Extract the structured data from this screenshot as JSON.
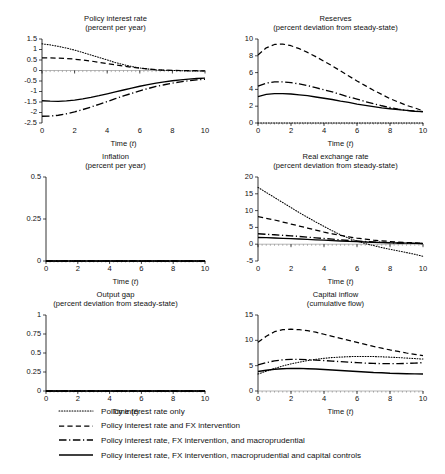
{
  "figure": {
    "x_axis_title": "Time (t)",
    "x_axis_title_main": "Time (",
    "x_axis_title_var": "t",
    "x_axis_title_end": ")"
  },
  "legend": {
    "position": "bottom",
    "items": [
      {
        "label": "Policy interest rate only",
        "style": "dotted",
        "key": "dotted-line-key"
      },
      {
        "label": "Policy interest rate and FX intervention",
        "style": "dashed",
        "key": "dashed-line-key"
      },
      {
        "label": "Policy interest rate, FX intervention, and macroprudential",
        "style": "dashdot",
        "key": "dashdot-line-key"
      },
      {
        "label": "Policy interest rate, FX intervention, macroprudential and capital controls",
        "style": "solid",
        "key": "solid-line-key"
      }
    ]
  },
  "chart_data": [
    {
      "id": "policy-interest-rate",
      "type": "line",
      "title": "Policy interest rate",
      "subtitle": "(percent per year)",
      "xlabel": "Time (t)",
      "ylabel": "",
      "xlim": [
        0,
        10
      ],
      "ylim": [
        -2.5,
        1.5
      ],
      "xticks": [
        0,
        2,
        4,
        6,
        8,
        10
      ],
      "yticks": [
        1.5,
        1,
        0.5,
        0,
        -0.5,
        -1,
        -1.5,
        -2,
        -2.5
      ],
      "ytick_labels": [
        "1.5",
        "1",
        "0.5",
        "0",
        "-0.5",
        "-1",
        "-1.5",
        "-2",
        "-2.5"
      ],
      "grid": false,
      "x": [
        0,
        0.5,
        1,
        1.5,
        2,
        2.5,
        3,
        3.5,
        4,
        4.5,
        5,
        5.5,
        6,
        6.5,
        7,
        7.5,
        8,
        8.5,
        9,
        9.5,
        10
      ],
      "series": [
        {
          "name": "Policy interest rate only",
          "style": "dotted",
          "values": [
            1.27,
            1.22,
            1.15,
            1.07,
            0.97,
            0.86,
            0.74,
            0.62,
            0.5,
            0.38,
            0.28,
            0.19,
            0.12,
            0.07,
            0.03,
            0.01,
            0.0,
            -0.01,
            -0.02,
            -0.02,
            -0.03
          ]
        },
        {
          "name": "Policy interest rate and FX intervention",
          "style": "dashed",
          "values": [
            0.6,
            0.6,
            0.59,
            0.57,
            0.54,
            0.5,
            0.45,
            0.39,
            0.33,
            0.27,
            0.21,
            0.16,
            0.11,
            0.07,
            0.04,
            0.02,
            0.01,
            0.0,
            -0.01,
            -0.01,
            -0.02
          ]
        },
        {
          "name": "Policy interest rate, FX intervention, and macroprudential",
          "style": "dashdot",
          "values": [
            -2.18,
            -2.17,
            -2.13,
            -2.06,
            -1.97,
            -1.86,
            -1.74,
            -1.61,
            -1.48,
            -1.34,
            -1.21,
            -1.09,
            -0.97,
            -0.86,
            -0.76,
            -0.68,
            -0.6,
            -0.54,
            -0.49,
            -0.45,
            -0.42
          ]
        },
        {
          "name": "Policy interest rate, FX intervention, macroprudential and capital controls",
          "style": "solid",
          "values": [
            -1.44,
            -1.46,
            -1.47,
            -1.45,
            -1.41,
            -1.35,
            -1.28,
            -1.2,
            -1.11,
            -1.02,
            -0.93,
            -0.84,
            -0.75,
            -0.67,
            -0.6,
            -0.54,
            -0.49,
            -0.45,
            -0.41,
            -0.38,
            -0.36
          ]
        }
      ]
    },
    {
      "id": "reserves",
      "type": "line",
      "title": "Reserves",
      "subtitle": "(percent deviation from steady-state)",
      "xlabel": "Time (t)",
      "ylabel": "",
      "xlim": [
        0,
        10
      ],
      "ylim": [
        0,
        10
      ],
      "xticks": [
        0,
        2,
        4,
        6,
        8,
        10
      ],
      "yticks": [
        0,
        2,
        4,
        6,
        8,
        10
      ],
      "ytick_labels": [
        "0",
        "2",
        "4",
        "6",
        "8",
        "10"
      ],
      "grid": false,
      "x": [
        0,
        0.5,
        1,
        1.5,
        2,
        2.5,
        3,
        3.5,
        4,
        4.5,
        5,
        5.5,
        6,
        6.5,
        7,
        7.5,
        8,
        8.5,
        9,
        9.5,
        10
      ],
      "series": [
        {
          "name": "Policy interest rate only",
          "style": "dotted",
          "values": [
            0,
            0,
            0,
            0,
            0,
            0,
            0,
            0,
            0,
            0,
            0,
            0,
            0,
            0,
            0,
            0,
            0,
            0,
            0,
            0,
            0
          ]
        },
        {
          "name": "Policy interest rate and FX intervention",
          "style": "dashed",
          "values": [
            8.1,
            8.95,
            9.35,
            9.4,
            9.2,
            8.85,
            8.4,
            7.9,
            7.35,
            6.8,
            6.2,
            5.6,
            5.0,
            4.45,
            3.9,
            3.4,
            2.9,
            2.5,
            2.1,
            1.8,
            1.45
          ]
        },
        {
          "name": "Policy interest rate, FX intervention, and macroprudential",
          "style": "dashdot",
          "values": [
            4.4,
            4.75,
            4.9,
            4.9,
            4.8,
            4.65,
            4.45,
            4.2,
            3.95,
            3.7,
            3.4,
            3.1,
            2.85,
            2.55,
            2.3,
            2.05,
            1.85,
            1.65,
            1.5,
            1.4,
            1.35
          ]
        },
        {
          "name": "Policy interest rate, FX intervention, macroprudential and capital controls",
          "style": "solid",
          "values": [
            3.15,
            3.4,
            3.5,
            3.5,
            3.45,
            3.35,
            3.25,
            3.1,
            2.95,
            2.8,
            2.6,
            2.45,
            2.25,
            2.1,
            1.95,
            1.8,
            1.7,
            1.6,
            1.5,
            1.4,
            1.35
          ]
        }
      ]
    },
    {
      "id": "inflation",
      "type": "line",
      "title": "Inflation",
      "subtitle": "(percent per year)",
      "xlabel": "Time (t)",
      "ylabel": "",
      "xlim": [
        0,
        10
      ],
      "ylim": [
        0,
        0.5
      ],
      "xticks": [
        0,
        2,
        4,
        6,
        8,
        10
      ],
      "yticks": [
        0.5,
        0.25,
        0
      ],
      "ytick_labels": [
        "0.5",
        "0.25",
        "0"
      ],
      "grid": false,
      "x": [
        0,
        2,
        4,
        6,
        8,
        10
      ],
      "series": [
        {
          "name": "Policy interest rate only",
          "style": "dotted",
          "values": [
            0,
            0,
            0,
            0,
            0,
            0
          ]
        },
        {
          "name": "Policy interest rate and FX intervention",
          "style": "dashed",
          "values": [
            0,
            0,
            0,
            0,
            0,
            0
          ]
        },
        {
          "name": "Policy interest rate, FX intervention, and macroprudential",
          "style": "dashdot",
          "values": [
            0,
            0,
            0,
            0,
            0,
            0
          ]
        },
        {
          "name": "Policy interest rate, FX intervention, macroprudential and capital controls",
          "style": "solid",
          "values": [
            0,
            0,
            0,
            0,
            0,
            0
          ]
        }
      ]
    },
    {
      "id": "real-exchange-rate",
      "type": "line",
      "title": "Real exchange rate",
      "subtitle": "(percent deviation from steady-state)",
      "xlabel": "Time (t)",
      "ylabel": "",
      "xlim": [
        0,
        10
      ],
      "ylim": [
        -5,
        20
      ],
      "xticks": [
        0,
        2,
        4,
        6,
        8,
        10
      ],
      "yticks": [
        20,
        15,
        10,
        5,
        0,
        -5
      ],
      "ytick_labels": [
        "20",
        "15",
        "10",
        "5",
        "0",
        "-5"
      ],
      "grid": false,
      "x": [
        0,
        0.5,
        1,
        1.5,
        2,
        2.5,
        3,
        3.5,
        4,
        4.5,
        5,
        5.5,
        6,
        6.5,
        7,
        7.5,
        8,
        8.5,
        9,
        9.5,
        10
      ],
      "series": [
        {
          "name": "Policy interest rate only",
          "style": "dotted",
          "values": [
            16.9,
            15.4,
            13.9,
            12.4,
            10.9,
            9.4,
            8.0,
            6.6,
            5.3,
            4.0,
            2.8,
            1.8,
            0.9,
            0.2,
            -0.4,
            -1.0,
            -1.5,
            -2.0,
            -2.5,
            -3.0,
            -3.6
          ]
        },
        {
          "name": "Policy interest rate and FX intervention",
          "style": "dashed",
          "values": [
            8.2,
            7.7,
            7.2,
            6.6,
            6.0,
            5.4,
            4.8,
            4.2,
            3.6,
            3.1,
            2.6,
            2.2,
            1.8,
            1.5,
            1.2,
            1.0,
            0.8,
            0.6,
            0.5,
            0.4,
            0.3
          ]
        },
        {
          "name": "Policy interest rate, FX intervention, and macroprudential",
          "style": "dashdot",
          "values": [
            3.1,
            2.95,
            2.8,
            2.65,
            2.5,
            2.3,
            2.1,
            1.9,
            1.7,
            1.5,
            1.3,
            1.1,
            0.95,
            0.8,
            0.65,
            0.55,
            0.45,
            0.35,
            0.3,
            0.25,
            0.2
          ]
        },
        {
          "name": "Policy interest rate, FX intervention, macroprudential and capital controls",
          "style": "solid",
          "values": [
            2.0,
            1.95,
            1.85,
            1.75,
            1.65,
            1.55,
            1.45,
            1.3,
            1.2,
            1.05,
            0.95,
            0.85,
            0.75,
            0.65,
            0.55,
            0.5,
            0.4,
            0.35,
            0.3,
            0.25,
            0.2
          ]
        }
      ]
    },
    {
      "id": "output-gap",
      "type": "line",
      "title": "Output gap",
      "subtitle": "(percent deviation from steady-state)",
      "xlabel": "Time (t)",
      "ylabel": "",
      "xlim": [
        0,
        10
      ],
      "ylim": [
        0,
        1
      ],
      "xticks": [
        0,
        2,
        4,
        6,
        8,
        10
      ],
      "yticks": [
        1,
        0.75,
        0.5,
        0.25,
        0
      ],
      "ytick_labels": [
        "1",
        "0.75",
        "0.5",
        "0.25",
        "0"
      ],
      "grid": false,
      "x": [
        0,
        2,
        4,
        6,
        8,
        10
      ],
      "series": [
        {
          "name": "Policy interest rate only",
          "style": "dotted",
          "values": [
            0,
            0,
            0,
            0,
            0,
            0
          ]
        },
        {
          "name": "Policy interest rate and FX intervention",
          "style": "dashed",
          "values": [
            0,
            0,
            0,
            0,
            0,
            0
          ]
        },
        {
          "name": "Policy interest rate, FX intervention, and macroprudential",
          "style": "dashdot",
          "values": [
            0,
            0,
            0,
            0,
            0,
            0
          ]
        },
        {
          "name": "Policy interest rate, FX intervention, macroprudential and capital controls",
          "style": "solid",
          "values": [
            0,
            0,
            0,
            0,
            0,
            0
          ]
        }
      ]
    },
    {
      "id": "capital-inflow",
      "type": "line",
      "title": "Capital inflow",
      "subtitle": "(cumulative flow)",
      "xlabel": "Time (t)",
      "ylabel": "",
      "xlim": [
        0,
        10
      ],
      "ylim": [
        0,
        15
      ],
      "xticks": [
        0,
        2,
        4,
        6,
        8,
        10
      ],
      "yticks": [
        15,
        10,
        5,
        0
      ],
      "ytick_labels": [
        "15",
        "10",
        "5",
        "0"
      ],
      "grid": false,
      "x": [
        0,
        0.5,
        1,
        1.5,
        2,
        2.5,
        3,
        3.5,
        4,
        4.5,
        5,
        5.5,
        6,
        6.5,
        7,
        7.5,
        8,
        8.5,
        9,
        9.5,
        10
      ],
      "series": [
        {
          "name": "Policy interest rate only",
          "style": "dotted",
          "values": [
            3.35,
            3.9,
            4.45,
            4.95,
            5.35,
            5.7,
            6.0,
            6.25,
            6.45,
            6.6,
            6.7,
            6.78,
            6.82,
            6.82,
            6.8,
            6.75,
            6.68,
            6.6,
            6.5,
            6.4,
            6.3
          ]
        },
        {
          "name": "Policy interest rate and FX intervention",
          "style": "dashed",
          "values": [
            9.6,
            10.8,
            11.7,
            12.1,
            12.2,
            12.1,
            11.9,
            11.6,
            11.2,
            10.8,
            10.4,
            10.0,
            9.6,
            9.2,
            8.8,
            8.45,
            8.1,
            7.8,
            7.5,
            7.25,
            7.0
          ]
        },
        {
          "name": "Policy interest rate, FX intervention, and macroprudential",
          "style": "dashdot",
          "values": [
            5.15,
            5.6,
            5.95,
            6.15,
            6.25,
            6.25,
            6.2,
            6.1,
            6.0,
            5.9,
            5.8,
            5.7,
            5.6,
            5.5,
            5.45,
            5.4,
            5.4,
            5.4,
            5.45,
            5.5,
            5.6
          ]
        },
        {
          "name": "Policy interest rate, FX intervention, macroprudential and capital controls",
          "style": "solid",
          "values": [
            3.85,
            4.1,
            4.3,
            4.4,
            4.45,
            4.45,
            4.4,
            4.35,
            4.25,
            4.15,
            4.05,
            3.95,
            3.85,
            3.75,
            3.65,
            3.6,
            3.5,
            3.45,
            3.4,
            3.38,
            3.35
          ]
        }
      ]
    }
  ]
}
